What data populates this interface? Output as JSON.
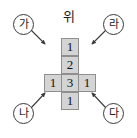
{
  "figure": {
    "title_label": "위",
    "background_color": "#ffffff"
  },
  "grid": {
    "cell_fill_color": "#d4d4d4",
    "cell_border_color": "#8f8f8f",
    "shape": "plus-cross",
    "rows": 4,
    "cols": 3,
    "cells": [
      {
        "row": 0,
        "col": 1,
        "value": "1"
      },
      {
        "row": 1,
        "col": 1,
        "value": "2"
      },
      {
        "row": 2,
        "col": 0,
        "value": "1"
      },
      {
        "row": 2,
        "col": 1,
        "value": "3"
      },
      {
        "row": 2,
        "col": 2,
        "value": "1"
      },
      {
        "row": 3,
        "col": 1,
        "value": "1"
      }
    ]
  },
  "markers": [
    {
      "id": "ga",
      "label": "가",
      "position": "top-left",
      "arrow_direction": "down-right"
    },
    {
      "id": "ra",
      "label": "라",
      "position": "top-right",
      "arrow_direction": "down-left"
    },
    {
      "id": "na",
      "label": "나",
      "position": "bottom-left",
      "arrow_direction": "up-right"
    },
    {
      "id": "da",
      "label": "다",
      "position": "bottom-right",
      "arrow_direction": "up-left"
    }
  ],
  "colors": {
    "line": "#3a3a3a",
    "text": "#1a1a1a"
  }
}
